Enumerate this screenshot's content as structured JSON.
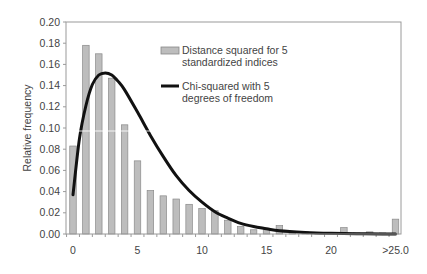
{
  "chart_data": {
    "type": "bar",
    "title": "",
    "xlabel": "",
    "ylabel": "Relative frequency",
    "ylim": [
      0,
      0.2
    ],
    "yticks": [
      "0.00",
      "0.02",
      "0.04",
      "0.06",
      "0.08",
      "0.10",
      "0.12",
      "0.14",
      "0.16",
      "0.18",
      "0.20"
    ],
    "xtick_labels": [
      "0",
      "5",
      "10",
      "15",
      "20",
      ">25.0"
    ],
    "grid": false,
    "legend_position": "upper-right-inside",
    "categories": [
      "0",
      "1",
      "2",
      "3",
      "4",
      "5",
      "6",
      "7",
      "8",
      "9",
      "10",
      "11",
      "12",
      "13",
      "14",
      "15",
      "16",
      "17",
      "18",
      "19",
      "20",
      "21",
      "22",
      "23",
      "24",
      ">25.0"
    ],
    "series": [
      {
        "name": "Distance squared for 5 standardized indices",
        "type": "bar",
        "color": "#bdbdbd",
        "values": [
          0.083,
          0.178,
          0.17,
          0.147,
          0.103,
          0.069,
          0.041,
          0.036,
          0.033,
          0.028,
          0.024,
          0.022,
          0.013,
          0.007,
          0.004,
          0.004,
          0.008,
          0.002,
          0.002,
          0.001,
          0.001,
          0.006,
          0.001,
          0.002,
          0.001,
          0.014
        ]
      },
      {
        "name": "Chi-squared with 5 degrees of freedom",
        "type": "line",
        "color": "#111111",
        "x": [
          0,
          0.5,
          1,
          1.5,
          2,
          2.5,
          3,
          3.5,
          4,
          5,
          6,
          7,
          8,
          9,
          10,
          11,
          12,
          13,
          14,
          15,
          16,
          18,
          20,
          22,
          24,
          25
        ],
        "values": [
          0.037,
          0.09,
          0.121,
          0.141,
          0.15,
          0.152,
          0.15,
          0.144,
          0.136,
          0.115,
          0.093,
          0.073,
          0.055,
          0.041,
          0.03,
          0.021,
          0.015,
          0.01,
          0.007,
          0.005,
          0.003,
          0.0015,
          0.0007,
          0.0003,
          0.0001,
          0.0001
        ]
      }
    ]
  },
  "legend": {
    "bar_label_line1": "Distance squared for 5",
    "bar_label_line2": "standardized indices",
    "line_label_line1": "Chi-squared with 5",
    "line_label_line2": "degrees of freedom"
  },
  "axis": {
    "ylabel": "Relative frequency"
  }
}
